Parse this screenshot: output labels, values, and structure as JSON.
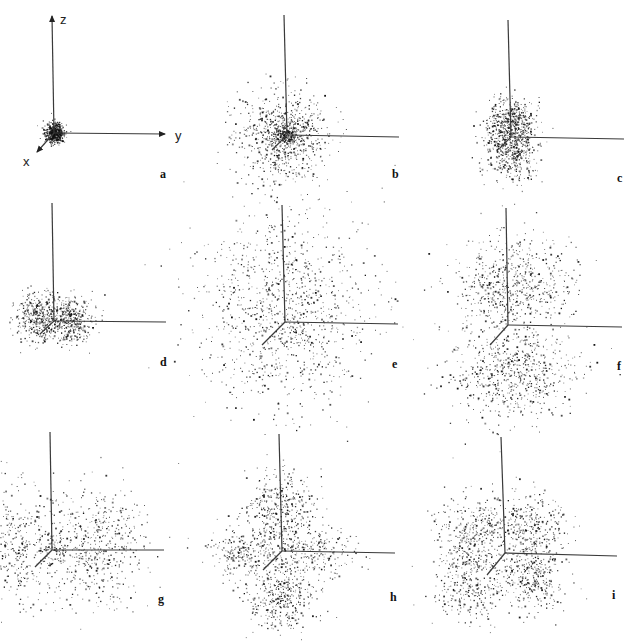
{
  "figure": {
    "axis_labels": {
      "x": "x",
      "y": "y",
      "z": "z"
    },
    "axis_color": "#3a3a3a",
    "point_color": "#111111"
  },
  "panels": [
    {
      "id": "a",
      "label": "a",
      "origin": [
        54,
        133
      ],
      "z_top": [
        52,
        16
      ],
      "y_end": [
        165,
        134
      ],
      "x_end": [
        37,
        152
      ],
      "show_axis_labels": true,
      "arrows": true,
      "label_pos": [
        160,
        178
      ],
      "clusters": [
        {
          "cx": 54,
          "cy": 133,
          "sx": 5,
          "sy": 5,
          "n": 520
        }
      ]
    },
    {
      "id": "b",
      "label": "b",
      "origin": [
        287,
        135
      ],
      "z_top": [
        284,
        15
      ],
      "y_end": [
        399,
        137
      ],
      "x_end": [
        272,
        150
      ],
      "show_axis_labels": false,
      "arrows": false,
      "label_pos": [
        392,
        178
      ],
      "clusters": [
        {
          "cx": 285,
          "cy": 134,
          "sx": 6,
          "sy": 5,
          "n": 200
        },
        {
          "cx": 283,
          "cy": 135,
          "sx": 22,
          "sy": 22,
          "n": 750
        }
      ]
    },
    {
      "id": "c",
      "label": "c",
      "origin": [
        511,
        137
      ],
      "z_top": [
        508,
        20
      ],
      "y_end": [
        624,
        139
      ],
      "x_end": [
        500,
        148
      ],
      "show_axis_labels": false,
      "arrows": false,
      "label_pos": [
        617,
        182
      ],
      "clusters": [
        {
          "cx": 510,
          "cy": 122,
          "sx": 12,
          "sy": 12,
          "n": 480
        },
        {
          "cx": 511,
          "cy": 152,
          "sx": 13,
          "sy": 14,
          "n": 420
        }
      ]
    },
    {
      "id": "d",
      "label": "d",
      "origin": [
        54,
        321
      ],
      "z_top": [
        52,
        203
      ],
      "y_end": [
        166,
        322
      ],
      "x_end": [
        40,
        334
      ],
      "show_axis_labels": false,
      "arrows": false,
      "label_pos": [
        160,
        366
      ],
      "clusters": [
        {
          "cx": 38,
          "cy": 318,
          "sx": 12,
          "sy": 12,
          "n": 380
        },
        {
          "cx": 70,
          "cy": 320,
          "sx": 12,
          "sy": 12,
          "n": 380
        }
      ]
    },
    {
      "id": "e",
      "label": "e",
      "origin": [
        285,
        322
      ],
      "z_top": [
        282,
        205
      ],
      "y_end": [
        398,
        324
      ],
      "x_end": [
        262,
        345
      ],
      "show_axis_labels": false,
      "arrows": false,
      "label_pos": [
        392,
        368
      ],
      "clusters": [
        {
          "cx": 282,
          "cy": 310,
          "sx": 44,
          "sy": 48,
          "n": 1100
        }
      ]
    },
    {
      "id": "f",
      "label": "f",
      "origin": [
        508,
        325
      ],
      "z_top": [
        506,
        208
      ],
      "y_end": [
        622,
        327
      ],
      "x_end": [
        490,
        345
      ],
      "show_axis_labels": false,
      "arrows": false,
      "label_pos": [
        617,
        370
      ],
      "clusters": [
        {
          "cx": 512,
          "cy": 285,
          "sx": 30,
          "sy": 24,
          "n": 650
        },
        {
          "cx": 512,
          "cy": 372,
          "sx": 30,
          "sy": 24,
          "n": 650
        }
      ]
    },
    {
      "id": "g",
      "label": "g",
      "origin": [
        52,
        550
      ],
      "z_top": [
        50,
        432
      ],
      "y_end": [
        164,
        550
      ],
      "x_end": [
        35,
        567
      ],
      "show_axis_labels": false,
      "arrows": false,
      "label_pos": [
        158,
        603
      ],
      "clusters": [
        {
          "cx": 10,
          "cy": 545,
          "sx": 22,
          "sy": 30,
          "n": 420
        },
        {
          "cx": 95,
          "cy": 545,
          "sx": 26,
          "sy": 30,
          "n": 560
        },
        {
          "cx": 52,
          "cy": 550,
          "sx": 8,
          "sy": 6,
          "n": 60
        }
      ]
    },
    {
      "id": "h",
      "label": "h",
      "origin": [
        282,
        551
      ],
      "z_top": [
        279,
        434
      ],
      "y_end": [
        395,
        553
      ],
      "x_end": [
        263,
        570
      ],
      "show_axis_labels": false,
      "arrows": false,
      "label_pos": [
        390,
        601
      ],
      "clusters": [
        {
          "cx": 280,
          "cy": 510,
          "sx": 17,
          "sy": 20,
          "n": 420
        },
        {
          "cx": 280,
          "cy": 593,
          "sx": 17,
          "sy": 20,
          "n": 420
        },
        {
          "cx": 243,
          "cy": 552,
          "sx": 20,
          "sy": 12,
          "n": 230
        },
        {
          "cx": 318,
          "cy": 552,
          "sx": 20,
          "sy": 12,
          "n": 230
        }
      ]
    },
    {
      "id": "i",
      "label": "i",
      "origin": [
        505,
        553
      ],
      "z_top": [
        501,
        437
      ],
      "y_end": [
        617,
        556
      ],
      "x_end": [
        487,
        575
      ],
      "show_axis_labels": false,
      "arrows": false,
      "label_pos": [
        612,
        599
      ],
      "clusters": [
        {
          "cx": 473,
          "cy": 530,
          "sx": 18,
          "sy": 18,
          "n": 330
        },
        {
          "cx": 530,
          "cy": 527,
          "sx": 18,
          "sy": 18,
          "n": 330
        },
        {
          "cx": 468,
          "cy": 583,
          "sx": 18,
          "sy": 18,
          "n": 330
        },
        {
          "cx": 530,
          "cy": 578,
          "sx": 17,
          "sy": 17,
          "n": 330
        }
      ]
    }
  ]
}
